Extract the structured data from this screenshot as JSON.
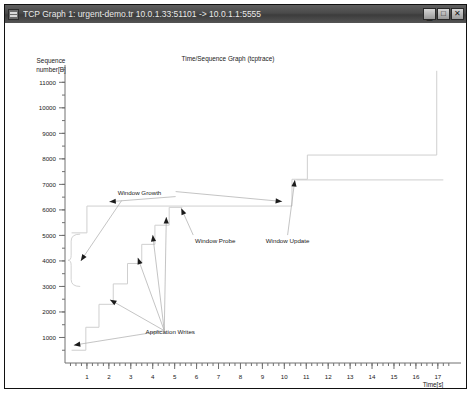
{
  "window": {
    "title": "TCP Graph 1: urgent-demo.tr 10.0.1.33:51101  -> 10.0.1.1:5555",
    "icon": "app-icon",
    "buttons": {
      "minimize_label": "_",
      "maximize_label": "□",
      "close_label": "✕"
    }
  },
  "chart_data": {
    "type": "line",
    "title": "Time/Sequence Graph (tcptrace)",
    "xlabel": "Time[s]",
    "ylabel": "Sequence number[B]",
    "grid": false,
    "legend": "none",
    "xlim": [
      0,
      17.6
    ],
    "ylim": [
      0,
      11600
    ],
    "xticks": [
      1,
      2,
      3,
      4,
      5,
      6,
      7,
      8,
      9,
      10,
      11,
      12,
      13,
      14,
      15,
      16,
      17
    ],
    "xtick_labels": [
      "1",
      "2",
      "3",
      "4",
      "5",
      "6",
      "7",
      "8",
      "9",
      "10",
      "11",
      "12",
      "13",
      "14",
      "15",
      "16",
      "17"
    ],
    "yticks": [
      1000,
      2000,
      3000,
      4000,
      5000,
      6000,
      7000,
      8000,
      9000,
      10000,
      11000
    ],
    "ytick_labels": [
      "1000",
      "2000",
      "3000",
      "4000",
      "5000",
      "6000",
      "7000",
      "8000",
      "9000",
      "10000",
      "11000"
    ],
    "xminor_step": 0.25,
    "yminor_step": 500,
    "series": [
      {
        "name": "data-sequence-staircase",
        "style": "step",
        "points": [
          [
            0.3,
            500
          ],
          [
            0.95,
            500
          ],
          [
            0.95,
            1400
          ],
          [
            1.55,
            1400
          ],
          [
            1.55,
            2300
          ],
          [
            2.2,
            2300
          ],
          [
            2.2,
            3100
          ],
          [
            2.85,
            3100
          ],
          [
            2.85,
            3900
          ],
          [
            3.5,
            3900
          ],
          [
            3.5,
            4650
          ],
          [
            4.1,
            4650
          ],
          [
            4.1,
            5400
          ],
          [
            4.75,
            5400
          ],
          [
            4.75,
            6100
          ],
          [
            5.35,
            6100
          ]
        ]
      },
      {
        "name": "advertised-window-upper-1",
        "style": "step",
        "points": [
          [
            0.3,
            5100
          ],
          [
            1.0,
            5100
          ],
          [
            1.0,
            6150
          ],
          [
            10.35,
            6150
          ]
        ]
      },
      {
        "name": "advertised-window-flat-probe",
        "style": "line",
        "points": [
          [
            10.35,
            6150
          ],
          [
            10.35,
            7200
          ]
        ]
      },
      {
        "name": "window-update-plateau",
        "style": "step",
        "points": [
          [
            10.35,
            7200
          ],
          [
            11.05,
            7200
          ],
          [
            11.05,
            8150
          ],
          [
            16.95,
            8150
          ]
        ]
      },
      {
        "name": "window-update-tail",
        "style": "line",
        "points": [
          [
            10.55,
            7175
          ],
          [
            17.25,
            7175
          ]
        ]
      },
      {
        "name": "final-rise",
        "style": "line",
        "points": [
          [
            16.95,
            8150
          ],
          [
            16.95,
            11450
          ]
        ]
      }
    ],
    "annotations": [
      {
        "id": "window-growth",
        "label": "Window Growth",
        "x": 2.4,
        "y": 6600
      },
      {
        "id": "window-probe",
        "label": "Window Probe",
        "x": 6.85,
        "y": 4700
      },
      {
        "id": "window-update",
        "label": "Window Update",
        "x": 10.15,
        "y": 4700
      },
      {
        "id": "application-writes",
        "label": "Application Writes",
        "x": 4.8,
        "y": 1150
      }
    ],
    "brace": {
      "label": "initial-window-brace",
      "x": 0.28,
      "y_from": 3000,
      "y_to": 5050
    }
  },
  "colors": {
    "series": "#cfcfcf",
    "axis": "#707070",
    "leader": "#aaaaaa",
    "arrow": "#1b1b1b",
    "titlebar": "#4a4a4a",
    "text": "#1a1a1a"
  }
}
